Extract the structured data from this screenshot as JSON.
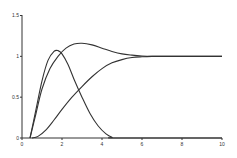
{
  "chart_data": {
    "type": "line",
    "title": "",
    "xlabel": "",
    "ylabel": "",
    "xlim": [
      0,
      10
    ],
    "ylim": [
      0,
      1.5
    ],
    "x_ticks": [
      "0",
      "2",
      "4",
      "6",
      "8",
      "10"
    ],
    "y_ticks": [
      "0",
      "0.5",
      "1",
      "1.5"
    ],
    "grid": false,
    "legend": "none",
    "series": [
      {
        "name": "curve-1",
        "x": [
          0.4,
          0.7,
          1.0,
          1.3,
          1.6,
          1.8,
          2.0,
          2.3,
          2.6,
          3.0,
          3.4,
          3.8,
          4.2,
          4.5,
          4.8,
          10.0
        ],
        "y": [
          0.0,
          0.35,
          0.7,
          0.95,
          1.06,
          1.07,
          1.03,
          0.9,
          0.72,
          0.5,
          0.3,
          0.15,
          0.05,
          0.01,
          0.0,
          0.0
        ]
      },
      {
        "name": "curve-2",
        "x": [
          0.4,
          0.7,
          1.0,
          1.4,
          1.8,
          2.2,
          2.6,
          3.0,
          3.5,
          4.0,
          4.5,
          5.0,
          5.5,
          6.0,
          6.5,
          7.0,
          10.0
        ],
        "y": [
          0.0,
          0.3,
          0.6,
          0.85,
          1.0,
          1.1,
          1.15,
          1.16,
          1.14,
          1.1,
          1.06,
          1.03,
          1.015,
          1.005,
          1.0,
          1.0,
          1.0
        ]
      },
      {
        "name": "curve-3",
        "x": [
          0.5,
          0.8,
          1.2,
          1.6,
          2.0,
          2.5,
          3.0,
          3.5,
          4.0,
          4.5,
          5.0,
          5.5,
          6.0,
          6.5,
          7.0,
          10.0
        ],
        "y": [
          0.0,
          0.02,
          0.1,
          0.22,
          0.35,
          0.5,
          0.63,
          0.75,
          0.85,
          0.92,
          0.96,
          0.985,
          0.995,
          1.0,
          1.0,
          1.0
        ]
      }
    ]
  }
}
